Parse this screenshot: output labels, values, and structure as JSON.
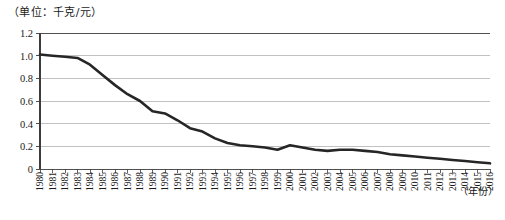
{
  "figure": {
    "unit_label": "（单位：千克/元）",
    "x_axis_title": "（年份）"
  },
  "colors": {
    "series_line": "#262626",
    "axis": "#3d3d3d",
    "gridline": "#a6a6a6",
    "background": "#ffffff",
    "text": "#1a1a1a"
  },
  "chart_data": {
    "type": "line",
    "title": "",
    "subtitle": "",
    "xlabel": "（年份）",
    "ylabel": "（单位：千克/元）",
    "xlim": [
      1980,
      2016
    ],
    "ylim": [
      0,
      1.2
    ],
    "ytick_labels": [
      "1.2",
      "1.0",
      "0.8",
      "0.6",
      "0.4",
      "0.2",
      "0"
    ],
    "yticks": [
      1.2,
      1.0,
      0.8,
      0.6,
      0.4,
      0.2,
      0
    ],
    "grid": true,
    "grid_axis": "y",
    "legend": false,
    "legend_position": "none",
    "markers": false,
    "categories": [
      "1980",
      "1981",
      "1982",
      "1983",
      "1984",
      "1985",
      "1986",
      "1987",
      "1988",
      "1989",
      "1990",
      "1991",
      "1992",
      "1993",
      "1994",
      "1995",
      "1996",
      "1997",
      "1998",
      "1999",
      "2000",
      "2001",
      "2002",
      "2003",
      "2004",
      "2005",
      "2006",
      "2007",
      "2008",
      "2009",
      "2010",
      "2011",
      "2012",
      "2013",
      "2014",
      "2015",
      "2016"
    ],
    "x": [
      1980,
      1981,
      1982,
      1983,
      1984,
      1985,
      1986,
      1987,
      1988,
      1989,
      1990,
      1991,
      1992,
      1993,
      1994,
      1995,
      1996,
      1997,
      1998,
      1999,
      2000,
      2001,
      2002,
      2003,
      2004,
      2005,
      2006,
      2007,
      2008,
      2009,
      2010,
      2011,
      2012,
      2013,
      2014,
      2015,
      2016
    ],
    "values": [
      1.01,
      1.0,
      0.99,
      0.98,
      0.92,
      0.83,
      0.74,
      0.66,
      0.6,
      0.51,
      0.49,
      0.43,
      0.36,
      0.33,
      0.27,
      0.23,
      0.21,
      0.2,
      0.19,
      0.17,
      0.21,
      0.19,
      0.17,
      0.16,
      0.17,
      0.17,
      0.16,
      0.15,
      0.13,
      0.12,
      0.11,
      0.1,
      0.09,
      0.08,
      0.07,
      0.06,
      0.05
    ]
  }
}
